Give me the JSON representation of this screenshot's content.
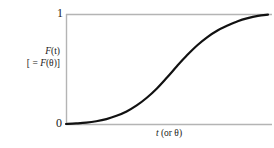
{
  "figure": {
    "background_color": "#ffffff",
    "curve_color": "#111111",
    "axis_color": "#b4b4b4",
    "text_color": "#1a1a1a"
  },
  "axes": {
    "y_tick_top_label": "1",
    "y_tick_bottom_label": "0",
    "y_axis_label_line1_var": "F",
    "y_axis_label_line1_arg": "(t)",
    "y_axis_label_line2_prefix": "[ = ",
    "y_axis_label_line2_var": "F",
    "y_axis_label_line2_arg": "(θ)",
    "y_axis_label_line2_suffix": "]",
    "y_axis_label_full": "F(t) [ = F(θ)]",
    "x_axis_label_var": "t",
    "x_axis_label_rest": " (or θ)",
    "x_axis_label_full": "t (or θ)"
  },
  "chart_data": {
    "type": "line",
    "title": "",
    "subtitle": "",
    "xlabel": "t (or θ)",
    "ylabel": "F(t) [ = F(θ)]",
    "xlim": [
      0,
      1
    ],
    "ylim": [
      0,
      1
    ],
    "grid": false,
    "legend": null,
    "xticks": [],
    "xticklabels": [],
    "yticks": [
      0,
      1
    ],
    "yticklabels": [
      "0",
      "1"
    ],
    "annotations": [],
    "series": [
      {
        "name": "cumulative distribution function F(t)",
        "shape": "sigmoid S-curve, monotonically increasing from 0 to 1",
        "x": [
          0.0,
          0.05,
          0.1,
          0.15,
          0.2,
          0.25,
          0.3,
          0.35,
          0.4,
          0.45,
          0.5,
          0.55,
          0.6,
          0.65,
          0.7,
          0.75,
          0.8,
          0.85,
          0.9,
          0.95,
          1.0
        ],
        "values": [
          0.0,
          0.005,
          0.012,
          0.025,
          0.045,
          0.075,
          0.115,
          0.17,
          0.24,
          0.325,
          0.425,
          0.53,
          0.63,
          0.72,
          0.795,
          0.855,
          0.9,
          0.94,
          0.968,
          0.988,
          1.0
        ]
      }
    ]
  }
}
